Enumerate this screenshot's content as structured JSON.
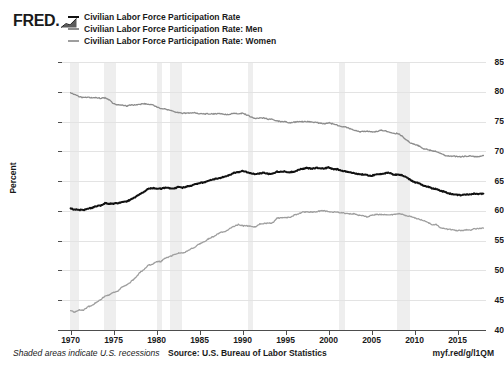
{
  "brand": {
    "logo_text": "FRED.",
    "logo_icon": "mini-line-chart-icon"
  },
  "footer": {
    "note": "Shaded areas indicate U.S. recessions",
    "source": "Source: U.S. Bureau of Labor Statistics",
    "url": "myf.red/g/l1QM"
  },
  "chart_data": {
    "type": "line",
    "title": "",
    "xlabel": "",
    "ylabel": "Percent",
    "xlim": [
      1969.0,
      2018.3
    ],
    "ylim": [
      40,
      85
    ],
    "grid": true,
    "legend_position": "top",
    "yticks": [
      85,
      80,
      75,
      70,
      65,
      60,
      55,
      50,
      45,
      40
    ],
    "xticks": [
      1970,
      1975,
      1980,
      1985,
      1990,
      1995,
      2000,
      2005,
      2010,
      2015
    ],
    "ytick_labels": [
      "85",
      "80",
      "75",
      "70",
      "65",
      "60",
      "55",
      "50",
      "45",
      "40"
    ],
    "xtick_labels": [
      "1970",
      "1975",
      "1980",
      "1985",
      "1990",
      "1995",
      "2000",
      "2005",
      "2010",
      "2015"
    ],
    "colors": {
      "total": "#111111",
      "men": "#8c8c8c",
      "women": "#9e9e9e",
      "recession_band": "#eeeeee",
      "gridline": "#e3e3e3",
      "axis": "#4d4d4d"
    },
    "recessions": [
      {
        "label": "1969-1970",
        "start": 1969.92,
        "end": 1970.92
      },
      {
        "label": "1973-1975",
        "start": 1973.92,
        "end": 1975.25
      },
      {
        "label": "1980",
        "start": 1980.08,
        "end": 1980.58
      },
      {
        "label": "1981-1982",
        "start": 1981.58,
        "end": 1982.92
      },
      {
        "label": "1990-1991",
        "start": 1990.58,
        "end": 1991.25
      },
      {
        "label": "2001",
        "start": 2001.25,
        "end": 2001.92
      },
      {
        "label": "2007-2009",
        "start": 2007.92,
        "end": 2009.5
      }
    ],
    "series": [
      {
        "name": "Civilian Labor Force Participation Rate",
        "color": "#111111",
        "x": [
          1970.0,
          1970.5,
          1971.0,
          1971.5,
          1972.0,
          1972.5,
          1973.0,
          1973.5,
          1974.0,
          1974.5,
          1975.0,
          1975.5,
          1976.0,
          1976.5,
          1977.0,
          1977.5,
          1978.0,
          1978.5,
          1979.0,
          1979.5,
          1980.0,
          1980.5,
          1981.0,
          1981.5,
          1982.0,
          1982.5,
          1983.0,
          1983.5,
          1984.0,
          1984.5,
          1985.0,
          1985.5,
          1986.0,
          1986.5,
          1987.0,
          1987.5,
          1988.0,
          1988.5,
          1989.0,
          1989.5,
          1990.0,
          1990.5,
          1991.0,
          1991.5,
          1992.0,
          1992.5,
          1993.0,
          1993.5,
          1994.0,
          1994.5,
          1995.0,
          1995.5,
          1996.0,
          1996.5,
          1997.0,
          1997.5,
          1998.0,
          1998.5,
          1999.0,
          1999.5,
          2000.0,
          2000.5,
          2001.0,
          2001.5,
          2002.0,
          2002.5,
          2003.0,
          2003.5,
          2004.0,
          2004.5,
          2005.0,
          2005.5,
          2006.0,
          2006.5,
          2007.0,
          2007.5,
          2008.0,
          2008.5,
          2009.0,
          2009.5,
          2010.0,
          2010.5,
          2011.0,
          2011.5,
          2012.0,
          2012.5,
          2013.0,
          2013.5,
          2014.0,
          2014.5,
          2015.0,
          2015.5,
          2016.0,
          2016.5,
          2017.0,
          2017.5,
          2018.0
        ],
        "y": [
          60.4,
          60.2,
          60.2,
          60.1,
          60.4,
          60.5,
          60.8,
          60.9,
          61.3,
          61.2,
          61.2,
          61.3,
          61.5,
          61.6,
          61.9,
          62.3,
          62.8,
          63.2,
          63.7,
          63.8,
          63.8,
          63.7,
          63.9,
          63.8,
          63.7,
          64.0,
          63.9,
          64.1,
          64.2,
          64.5,
          64.7,
          64.8,
          65.0,
          65.3,
          65.4,
          65.6,
          65.8,
          66.0,
          66.4,
          66.5,
          66.7,
          66.5,
          66.3,
          66.1,
          66.3,
          66.4,
          66.2,
          66.3,
          66.6,
          66.6,
          66.6,
          66.5,
          66.6,
          66.9,
          67.1,
          67.2,
          67.1,
          67.2,
          67.2,
          67.1,
          67.3,
          67.0,
          67.0,
          66.8,
          66.6,
          66.5,
          66.3,
          66.2,
          66.1,
          66.0,
          65.9,
          66.1,
          66.2,
          66.3,
          66.4,
          66.1,
          66.1,
          66.0,
          65.7,
          65.2,
          64.8,
          64.7,
          64.2,
          64.1,
          63.8,
          63.7,
          63.4,
          63.2,
          62.9,
          62.8,
          62.7,
          62.6,
          62.8,
          62.8,
          62.9,
          62.8,
          62.9
        ]
      },
      {
        "name": "Civilian Labor Force Participation Rate: Men",
        "color": "#8c8c8c",
        "x": [
          1970.0,
          1970.5,
          1971.0,
          1971.5,
          1972.0,
          1972.5,
          1973.0,
          1973.5,
          1974.0,
          1974.5,
          1975.0,
          1975.5,
          1976.0,
          1976.5,
          1977.0,
          1977.5,
          1978.0,
          1978.5,
          1979.0,
          1979.5,
          1980.0,
          1980.5,
          1981.0,
          1981.5,
          1982.0,
          1982.5,
          1983.0,
          1983.5,
          1984.0,
          1984.5,
          1985.0,
          1985.5,
          1986.0,
          1986.5,
          1987.0,
          1987.5,
          1988.0,
          1988.5,
          1989.0,
          1989.5,
          1990.0,
          1990.5,
          1991.0,
          1991.5,
          1992.0,
          1992.5,
          1993.0,
          1993.5,
          1994.0,
          1994.5,
          1995.0,
          1995.5,
          1996.0,
          1996.5,
          1997.0,
          1997.5,
          1998.0,
          1998.5,
          1999.0,
          1999.5,
          2000.0,
          2000.5,
          2001.0,
          2001.5,
          2002.0,
          2002.5,
          2003.0,
          2003.5,
          2004.0,
          2004.5,
          2005.0,
          2005.5,
          2006.0,
          2006.5,
          2007.0,
          2007.5,
          2008.0,
          2008.5,
          2009.0,
          2009.5,
          2010.0,
          2010.5,
          2011.0,
          2011.5,
          2012.0,
          2012.5,
          2013.0,
          2013.5,
          2014.0,
          2014.5,
          2015.0,
          2015.5,
          2016.0,
          2016.5,
          2017.0,
          2017.5,
          2018.0
        ],
        "y": [
          79.8,
          79.5,
          79.2,
          79.0,
          79.1,
          79.0,
          79.0,
          78.9,
          79.0,
          78.6,
          78.0,
          77.8,
          77.8,
          77.6,
          77.8,
          77.8,
          77.9,
          78.0,
          77.9,
          77.8,
          77.5,
          77.2,
          77.1,
          76.9,
          76.7,
          76.5,
          76.4,
          76.4,
          76.5,
          76.5,
          76.3,
          76.3,
          76.3,
          76.3,
          76.3,
          76.3,
          76.2,
          76.2,
          76.4,
          76.3,
          76.4,
          76.1,
          75.8,
          75.5,
          75.6,
          75.6,
          75.4,
          75.4,
          75.1,
          75.0,
          75.0,
          74.8,
          74.9,
          75.0,
          75.0,
          75.0,
          74.9,
          74.9,
          74.7,
          74.6,
          74.8,
          74.6,
          74.4,
          74.1,
          74.1,
          73.8,
          73.5,
          73.3,
          73.3,
          73.4,
          73.3,
          73.3,
          73.5,
          73.5,
          73.2,
          73.0,
          73.0,
          72.6,
          72.0,
          71.4,
          71.2,
          70.9,
          70.5,
          70.3,
          70.1,
          70.0,
          69.7,
          69.3,
          69.2,
          69.2,
          69.1,
          69.1,
          69.2,
          69.2,
          69.1,
          69.1,
          69.3
        ]
      },
      {
        "name": "Civilian Labor Force Participation Rate: Women",
        "color": "#9e9e9e",
        "x": [
          1970.0,
          1970.5,
          1971.0,
          1971.5,
          1972.0,
          1972.5,
          1973.0,
          1973.5,
          1974.0,
          1974.5,
          1975.0,
          1975.5,
          1976.0,
          1976.5,
          1977.0,
          1977.5,
          1978.0,
          1978.5,
          1979.0,
          1979.5,
          1980.0,
          1980.5,
          1981.0,
          1981.5,
          1982.0,
          1982.5,
          1983.0,
          1983.5,
          1984.0,
          1984.5,
          1985.0,
          1985.5,
          1986.0,
          1986.5,
          1987.0,
          1987.5,
          1988.0,
          1988.5,
          1989.0,
          1989.5,
          1990.0,
          1990.5,
          1991.0,
          1991.5,
          1992.0,
          1992.5,
          1993.0,
          1993.5,
          1994.0,
          1994.5,
          1995.0,
          1995.5,
          1996.0,
          1996.5,
          1997.0,
          1997.5,
          1998.0,
          1998.5,
          1999.0,
          1999.5,
          2000.0,
          2000.5,
          2001.0,
          2001.5,
          2002.0,
          2002.5,
          2003.0,
          2003.5,
          2004.0,
          2004.5,
          2005.0,
          2005.5,
          2006.0,
          2006.5,
          2007.0,
          2007.5,
          2008.0,
          2008.5,
          2009.0,
          2009.5,
          2010.0,
          2010.5,
          2011.0,
          2011.5,
          2012.0,
          2012.5,
          2013.0,
          2013.5,
          2014.0,
          2014.5,
          2015.0,
          2015.5,
          2016.0,
          2016.5,
          2017.0,
          2017.5,
          2018.0
        ],
        "y": [
          43.3,
          43.0,
          43.4,
          43.3,
          43.9,
          44.1,
          44.7,
          45.1,
          45.7,
          45.9,
          46.3,
          46.5,
          47.3,
          47.5,
          48.1,
          48.7,
          49.6,
          50.1,
          50.9,
          51.0,
          51.5,
          51.5,
          52.1,
          52.3,
          52.6,
          52.9,
          52.9,
          53.2,
          53.6,
          54.0,
          54.5,
          54.8,
          55.3,
          55.6,
          56.0,
          56.4,
          56.6,
          57.0,
          57.4,
          57.7,
          57.5,
          57.5,
          57.4,
          57.3,
          57.8,
          57.9,
          57.9,
          58.0,
          58.8,
          58.8,
          58.9,
          58.9,
          59.3,
          59.5,
          59.8,
          59.8,
          59.8,
          59.8,
          60.0,
          60.0,
          59.9,
          59.8,
          59.8,
          59.7,
          59.6,
          59.5,
          59.5,
          59.3,
          59.2,
          59.0,
          59.3,
          59.4,
          59.4,
          59.4,
          59.3,
          59.4,
          59.5,
          59.5,
          59.2,
          59.1,
          58.8,
          58.6,
          58.4,
          58.1,
          57.7,
          57.7,
          57.2,
          57.0,
          56.9,
          56.8,
          56.7,
          56.7,
          56.8,
          56.8,
          57.0,
          57.0,
          57.1
        ]
      }
    ]
  }
}
